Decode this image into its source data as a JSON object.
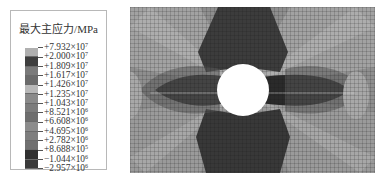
{
  "legend": {
    "title": "最大主应力/MPa",
    "entries": [
      {
        "mantissa": "+7.932",
        "exp": "7"
      },
      {
        "mantissa": "+2.000",
        "exp": "7"
      },
      {
        "mantissa": "+1.809",
        "exp": "7"
      },
      {
        "mantissa": "+1.617",
        "exp": "7"
      },
      {
        "mantissa": "+1.426",
        "exp": "7"
      },
      {
        "mantissa": "+1.235",
        "exp": "7"
      },
      {
        "mantissa": "+1.043",
        "exp": "7"
      },
      {
        "mantissa": "+8.521",
        "exp": "6"
      },
      {
        "mantissa": "+6.608",
        "exp": "6"
      },
      {
        "mantissa": "+4.695",
        "exp": "6"
      },
      {
        "mantissa": "+2.782",
        "exp": "6"
      },
      {
        "mantissa": "+8.688",
        "exp": "5"
      },
      {
        "mantissa": "−1.044",
        "exp": "6"
      },
      {
        "mantissa": "−2.957",
        "exp": "6"
      }
    ],
    "band_colors": [
      "#b0b0b0",
      "#3e3e3e",
      "#7a7a7a",
      "#6a6a6a",
      "#b8b8b8",
      "#8a8a8a",
      "#7c7c7c",
      "#6e6e6e",
      "#8c8c8c",
      "#7e7e7e",
      "#707070",
      "#303030",
      "#3a3a3a"
    ]
  },
  "plot": {
    "description": "Finite element mesh contour of maximum principal stress around a circular hole",
    "hole": {
      "cx": 113,
      "cy": 83,
      "r": 26
    }
  }
}
